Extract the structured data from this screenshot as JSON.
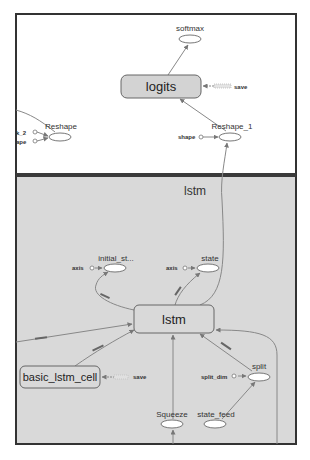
{
  "graph": {
    "outer_scope": {
      "nodes": {
        "softmax": "softmax",
        "logits": "logits",
        "logits_save": "save",
        "reshape": "Reshape",
        "reshape_in1": "k_2",
        "reshape_in2": "ape",
        "reshape_1": "Reshape_1",
        "reshape_1_in": "shape"
      }
    },
    "lstm_group": {
      "title": "lstm",
      "nodes": {
        "initial_state": "initial_st...",
        "initial_state_in": "axis",
        "state": "state",
        "state_in": "axis",
        "lstm": "lstm",
        "basic_lstm_cell": "basic_lstm_cell",
        "basic_lstm_cell_save": "save",
        "split": "split",
        "split_in": "split_dim",
        "squeeze": "Squeeze",
        "state_feed": "state_feed"
      }
    }
  },
  "colors": {
    "canvas_bg": "#ffffff",
    "group_bg": "#d9d9d9",
    "frame": "#333333",
    "box_fill": "#d3d3d3",
    "edge": "#888888"
  }
}
